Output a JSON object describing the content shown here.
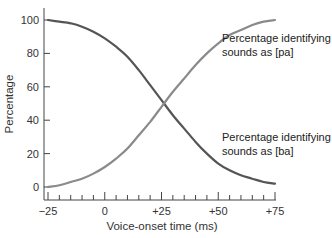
{
  "chart_data": {
    "type": "line",
    "title": "",
    "xlabel": "Voice-onset time (ms)",
    "ylabel": "Percentage",
    "xlim": [
      -25,
      75
    ],
    "ylim": [
      0,
      100
    ],
    "x_ticks": [
      -25,
      0,
      25,
      50,
      75
    ],
    "x_tick_labels": [
      "−25",
      "0",
      "+25",
      "+50",
      "+75"
    ],
    "x_minor_tick_step": 5,
    "y_ticks": [
      0,
      20,
      40,
      60,
      80,
      100
    ],
    "y_tick_labels": [
      "0",
      "20",
      "40",
      "60",
      "80",
      "100"
    ],
    "grid": false,
    "legend": "inline annotations",
    "x": [
      -25,
      -20,
      -15,
      -10,
      -5,
      0,
      5,
      10,
      15,
      20,
      25,
      30,
      35,
      40,
      45,
      50,
      55,
      60,
      65,
      70,
      75
    ],
    "series": [
      {
        "name": "Percentage identifying sounds as [ba]",
        "color": "#555555",
        "values": [
          100,
          99,
          98,
          96,
          93,
          89,
          84,
          78,
          70,
          61,
          52,
          43,
          35,
          27,
          20,
          14,
          10,
          7,
          5,
          3,
          2
        ]
      },
      {
        "name": "Percentage identifying sounds as [pa]",
        "color": "#8a8a8a",
        "values": [
          0,
          1,
          3,
          5,
          8,
          12,
          17,
          23,
          31,
          39,
          48,
          57,
          65,
          73,
          80,
          86,
          91,
          94,
          97,
          99,
          100
        ]
      }
    ],
    "annotations": [
      {
        "series": "pa",
        "lines": [
          "Percentage identifying",
          "sounds as [pa]"
        ]
      },
      {
        "series": "ba",
        "lines": [
          "Percentage identifying",
          "sounds as [ba]"
        ]
      }
    ]
  }
}
